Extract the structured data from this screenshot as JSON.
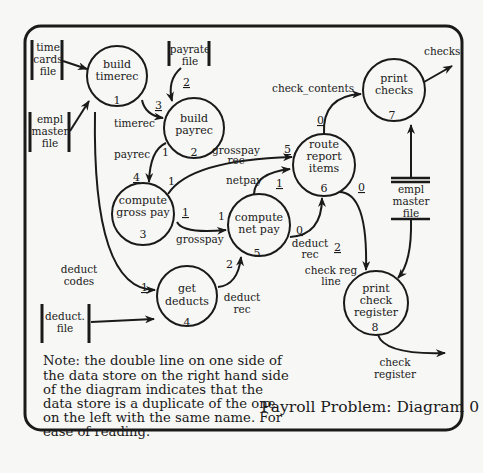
{
  "title": "Payroll Problem: Diagram 0",
  "note_lines": [
    "Note: the double line on one side of",
    "the data store on the right hand side",
    "of the diagram indicates that the",
    "data store is a duplicate of the one",
    "on the left with the same name. For",
    "ease of reading."
  ],
  "processes": [
    {
      "id": 1,
      "lines": [
        "build",
        "timerec"
      ],
      "num": "1"
    },
    {
      "id": 2,
      "lines": [
        "build",
        "payrec"
      ],
      "num": "2"
    },
    {
      "id": 3,
      "lines": [
        "compute",
        "gross pay"
      ],
      "num": "3"
    },
    {
      "id": 4,
      "lines": [
        "get",
        "deducts"
      ],
      "num": "4"
    },
    {
      "id": 5,
      "lines": [
        "compute",
        "net pay"
      ],
      "num": "5"
    },
    {
      "id": 6,
      "lines": [
        "route",
        "report",
        "items"
      ],
      "num": "6"
    },
    {
      "id": 7,
      "lines": [
        "print",
        "checks"
      ],
      "num": "7"
    },
    {
      "id": 8,
      "lines": [
        "print",
        "check",
        "register"
      ],
      "num": "8"
    }
  ],
  "stores": {
    "time_cards": [
      "time",
      "cards",
      "file"
    ],
    "empl_master_left": [
      "empl",
      "master",
      "file"
    ],
    "payrate": [
      "payrate",
      "file"
    ],
    "deduct": [
      "deduct.",
      "file"
    ],
    "empl_master_right": [
      "empl",
      "master",
      "file"
    ]
  },
  "flows": {
    "timerec": "timerec",
    "payrec": "payrec",
    "grosspay_rec": [
      "grosspay",
      "rec"
    ],
    "netpay": "netpay",
    "grosspay": "grosspay",
    "deduct_codes": [
      "deduct",
      "codes"
    ],
    "deduct_rec_lower": [
      "deduct",
      "rec"
    ],
    "deduct_rec_upper": [
      "deduct",
      "rec"
    ],
    "check_reg_line": [
      "check reg",
      "line"
    ],
    "check_contents": "check_contents",
    "checks": "checks",
    "check_register": [
      "check",
      "register"
    ]
  },
  "flow_numbers": {
    "n3_timerec": "3",
    "n2_payrate": "2",
    "n4_payrec": "4",
    "n1_payrec_out": "1",
    "n1_gross_out_top": "1",
    "n5_grosspay_rec": "5",
    "n1_netpay": "1",
    "n1_gross_out": "1",
    "n1_net_in": "1",
    "n0_net_out": "0",
    "n2_deduct_in": "2",
    "n0_route_top": "0",
    "n0_route_right": "0",
    "n1_deduct_codes": "1",
    "n2_get_deducts_out": "2"
  }
}
